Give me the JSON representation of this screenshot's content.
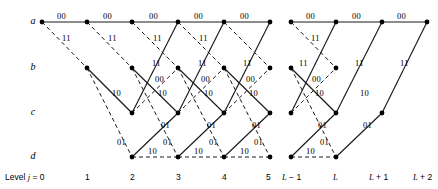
{
  "diagram": {
    "type": "trellis",
    "background_color": "#ffffff",
    "line_color": "#1a1a1a",
    "node_color": "#000000",
    "width": 438,
    "height": 189
  },
  "states": [
    {
      "id": "a",
      "label": "a",
      "y": 22
    },
    {
      "id": "b",
      "label": "b",
      "y": 68
    },
    {
      "id": "c",
      "label": "c",
      "y": 113
    },
    {
      "id": "d",
      "label": "d",
      "y": 157
    }
  ],
  "levels": [
    {
      "index": 0,
      "label": "Level j = 0",
      "x": 42,
      "label_x": 5,
      "italic_part": "j"
    },
    {
      "index": 1,
      "label": "1",
      "x": 87,
      "label_x": 85
    },
    {
      "index": 2,
      "label": "2",
      "x": 132,
      "label_x": 130
    },
    {
      "index": 3,
      "label": "3",
      "x": 178,
      "label_x": 176
    },
    {
      "index": 4,
      "label": "4",
      "x": 224,
      "label_x": 222
    },
    {
      "index": 5,
      "label": "5",
      "x": 270,
      "label_x": 266
    },
    {
      "index": 6,
      "label": "L − 1",
      "x": 291,
      "label_x": 282
    },
    {
      "index": 7,
      "label": "L",
      "x": 336,
      "label_x": 333
    },
    {
      "index": 8,
      "label": "L + 1",
      "x": 382,
      "label_x": 369
    },
    {
      "index": 9,
      "label": "L + 2",
      "x": 427,
      "label_x": 413
    }
  ],
  "nodes": [
    {
      "state": "a",
      "level": 0,
      "x": 42,
      "y": 22
    },
    {
      "state": "a",
      "level": 1,
      "x": 87,
      "y": 22
    },
    {
      "state": "a",
      "level": 2,
      "x": 132,
      "y": 22
    },
    {
      "state": "a",
      "level": 3,
      "x": 178,
      "y": 22
    },
    {
      "state": "a",
      "level": 4,
      "x": 224,
      "y": 22
    },
    {
      "state": "a",
      "level": 5,
      "x": 270,
      "y": 22
    },
    {
      "state": "a",
      "level": 6,
      "x": 291,
      "y": 22
    },
    {
      "state": "a",
      "level": 7,
      "x": 336,
      "y": 22
    },
    {
      "state": "a",
      "level": 8,
      "x": 382,
      "y": 22
    },
    {
      "state": "a",
      "level": 9,
      "x": 427,
      "y": 22
    },
    {
      "state": "b",
      "level": 1,
      "x": 87,
      "y": 68
    },
    {
      "state": "b",
      "level": 2,
      "x": 132,
      "y": 68
    },
    {
      "state": "b",
      "level": 3,
      "x": 178,
      "y": 68
    },
    {
      "state": "b",
      "level": 4,
      "x": 224,
      "y": 68
    },
    {
      "state": "b",
      "level": 5,
      "x": 270,
      "y": 68
    },
    {
      "state": "b",
      "level": 6,
      "x": 291,
      "y": 68
    },
    {
      "state": "b",
      "level": 7,
      "x": 336,
      "y": 68
    },
    {
      "state": "c",
      "level": 2,
      "x": 132,
      "y": 113
    },
    {
      "state": "c",
      "level": 3,
      "x": 178,
      "y": 113
    },
    {
      "state": "c",
      "level": 4,
      "x": 224,
      "y": 113
    },
    {
      "state": "c",
      "level": 5,
      "x": 270,
      "y": 113
    },
    {
      "state": "c",
      "level": 6,
      "x": 291,
      "y": 113
    },
    {
      "state": "c",
      "level": 7,
      "x": 336,
      "y": 113
    },
    {
      "state": "c",
      "level": 8,
      "x": 382,
      "y": 113
    },
    {
      "state": "d",
      "level": 2,
      "x": 132,
      "y": 157
    },
    {
      "state": "d",
      "level": 3,
      "x": 178,
      "y": 157
    },
    {
      "state": "d",
      "level": 4,
      "x": 224,
      "y": 157
    },
    {
      "state": "d",
      "level": 5,
      "x": 270,
      "y": 157
    },
    {
      "state": "d",
      "level": 6,
      "x": 291,
      "y": 157
    },
    {
      "state": "d",
      "level": 7,
      "x": 336,
      "y": 157
    }
  ],
  "edges": [
    {
      "from": [
        42,
        22
      ],
      "to": [
        87,
        22
      ],
      "style": "solid",
      "output": "00"
    },
    {
      "from": [
        87,
        22
      ],
      "to": [
        132,
        22
      ],
      "style": "solid",
      "output": "00"
    },
    {
      "from": [
        132,
        22
      ],
      "to": [
        178,
        22
      ],
      "style": "solid",
      "output": "00"
    },
    {
      "from": [
        178,
        22
      ],
      "to": [
        224,
        22
      ],
      "style": "solid",
      "output": "00"
    },
    {
      "from": [
        224,
        22
      ],
      "to": [
        270,
        22
      ],
      "style": "solid",
      "output": "00"
    },
    {
      "from": [
        291,
        22
      ],
      "to": [
        336,
        22
      ],
      "style": "solid",
      "output": "00"
    },
    {
      "from": [
        336,
        22
      ],
      "to": [
        382,
        22
      ],
      "style": "solid",
      "output": "00"
    },
    {
      "from": [
        382,
        22
      ],
      "to": [
        427,
        22
      ],
      "style": "solid",
      "output": "00"
    },
    {
      "from": [
        42,
        22
      ],
      "to": [
        87,
        68
      ],
      "style": "dashed",
      "output": "11"
    },
    {
      "from": [
        87,
        22
      ],
      "to": [
        132,
        68
      ],
      "style": "dashed",
      "output": "11"
    },
    {
      "from": [
        132,
        22
      ],
      "to": [
        178,
        68
      ],
      "style": "dashed",
      "output": "11"
    },
    {
      "from": [
        178,
        22
      ],
      "to": [
        224,
        68
      ],
      "style": "dashed",
      "output": "11"
    },
    {
      "from": [
        224,
        22
      ],
      "to": [
        270,
        68
      ],
      "style": "dashed",
      "output": "11"
    },
    {
      "from": [
        291,
        22
      ],
      "to": [
        336,
        68
      ],
      "style": "dashed",
      "output": "11"
    },
    {
      "from": [
        87,
        68
      ],
      "to": [
        132,
        113
      ],
      "style": "solid",
      "output": "10"
    },
    {
      "from": [
        132,
        68
      ],
      "to": [
        178,
        113
      ],
      "style": "solid",
      "output": "10"
    },
    {
      "from": [
        178,
        68
      ],
      "to": [
        224,
        113
      ],
      "style": "solid",
      "output": "10"
    },
    {
      "from": [
        224,
        68
      ],
      "to": [
        270,
        113
      ],
      "style": "solid",
      "output": "10"
    },
    {
      "from": [
        291,
        68
      ],
      "to": [
        336,
        113
      ],
      "style": "solid",
      "output": "10"
    },
    {
      "from": [
        87,
        68
      ],
      "to": [
        132,
        157
      ],
      "style": "dashed",
      "output": "01"
    },
    {
      "from": [
        132,
        68
      ],
      "to": [
        178,
        157
      ],
      "style": "dashed",
      "output": "01"
    },
    {
      "from": [
        178,
        68
      ],
      "to": [
        224,
        157
      ],
      "style": "dashed",
      "output": "01"
    },
    {
      "from": [
        224,
        68
      ],
      "to": [
        270,
        157
      ],
      "style": "dashed",
      "output": "01"
    },
    {
      "from": [
        291,
        68
      ],
      "to": [
        336,
        157
      ],
      "style": "dashed",
      "output": "01"
    },
    {
      "from": [
        132,
        113
      ],
      "to": [
        178,
        22
      ],
      "style": "solid",
      "output": "11"
    },
    {
      "from": [
        178,
        113
      ],
      "to": [
        224,
        22
      ],
      "style": "solid",
      "output": "11"
    },
    {
      "from": [
        224,
        113
      ],
      "to": [
        270,
        22
      ],
      "style": "solid",
      "output": "11"
    },
    {
      "from": [
        291,
        113
      ],
      "to": [
        336,
        22
      ],
      "style": "solid",
      "output": "11"
    },
    {
      "from": [
        336,
        113
      ],
      "to": [
        382,
        22
      ],
      "style": "solid",
      "output": "11"
    },
    {
      "from": [
        382,
        113
      ],
      "to": [
        427,
        22
      ],
      "style": "solid",
      "output": "11"
    },
    {
      "from": [
        132,
        113
      ],
      "to": [
        178,
        68
      ],
      "style": "dashed",
      "output": "00"
    },
    {
      "from": [
        178,
        113
      ],
      "to": [
        224,
        68
      ],
      "style": "dashed",
      "output": "00"
    },
    {
      "from": [
        224,
        113
      ],
      "to": [
        270,
        68
      ],
      "style": "dashed",
      "output": "00"
    },
    {
      "from": [
        291,
        113
      ],
      "to": [
        336,
        68
      ],
      "style": "dashed",
      "output": "00"
    },
    {
      "from": [
        132,
        157
      ],
      "to": [
        178,
        113
      ],
      "style": "solid",
      "output": "01"
    },
    {
      "from": [
        178,
        157
      ],
      "to": [
        224,
        113
      ],
      "style": "solid",
      "output": "01"
    },
    {
      "from": [
        224,
        157
      ],
      "to": [
        270,
        113
      ],
      "style": "solid",
      "output": "01"
    },
    {
      "from": [
        291,
        157
      ],
      "to": [
        336,
        113
      ],
      "style": "solid",
      "output": "01"
    },
    {
      "from": [
        336,
        157
      ],
      "to": [
        382,
        113
      ],
      "style": "solid",
      "output": "01"
    },
    {
      "from": [
        132,
        157
      ],
      "to": [
        178,
        157
      ],
      "style": "dashed",
      "output": "10"
    },
    {
      "from": [
        178,
        157
      ],
      "to": [
        224,
        157
      ],
      "style": "dashed",
      "output": "10"
    },
    {
      "from": [
        224,
        157
      ],
      "to": [
        270,
        157
      ],
      "style": "dashed",
      "output": "10"
    },
    {
      "from": [
        291,
        157
      ],
      "to": [
        336,
        157
      ],
      "style": "dashed",
      "output": "10"
    }
  ],
  "edge_labels": [
    {
      "text": "00",
      "x": 57,
      "y": 11
    },
    {
      "text": "00",
      "x": 103,
      "y": 11
    },
    {
      "text": "00",
      "x": 149,
      "y": 11
    },
    {
      "text": "00",
      "x": 194,
      "y": 11
    },
    {
      "text": "00",
      "x": 240,
      "y": 11
    },
    {
      "text": "00",
      "x": 306,
      "y": 11
    },
    {
      "text": "00",
      "x": 352,
      "y": 11
    },
    {
      "text": "00",
      "x": 397,
      "y": 11
    },
    {
      "text": "11",
      "x": 62,
      "y": 33
    },
    {
      "text": "11",
      "x": 108,
      "y": 33
    },
    {
      "text": "11",
      "x": 153,
      "y": 33
    },
    {
      "text": "11",
      "x": 199,
      "y": 33
    },
    {
      "text": "11",
      "x": 311,
      "y": 33
    },
    {
      "text": "11",
      "x": 152,
      "y": 58
    },
    {
      "text": "11",
      "x": 198,
      "y": 58
    },
    {
      "text": "11",
      "x": 243,
      "y": 58
    },
    {
      "text": "11",
      "x": 299,
      "y": 58
    },
    {
      "text": "11",
      "x": 355,
      "y": 58
    },
    {
      "text": "11",
      "x": 400,
      "y": 58
    },
    {
      "text": "00",
      "x": 155,
      "y": 74
    },
    {
      "text": "00",
      "x": 201,
      "y": 74
    },
    {
      "text": "00",
      "x": 246,
      "y": 74
    },
    {
      "text": "00",
      "x": 312,
      "y": 74
    },
    {
      "text": "10",
      "x": 112,
      "y": 88
    },
    {
      "text": "10",
      "x": 158,
      "y": 88
    },
    {
      "text": "10",
      "x": 204,
      "y": 88
    },
    {
      "text": "10",
      "x": 249,
      "y": 88
    },
    {
      "text": "10",
      "x": 315,
      "y": 88
    },
    {
      "text": "10",
      "x": 360,
      "y": 88
    },
    {
      "text": "01",
      "x": 161,
      "y": 120
    },
    {
      "text": "01",
      "x": 207,
      "y": 120
    },
    {
      "text": "01",
      "x": 252,
      "y": 120
    },
    {
      "text": "01",
      "x": 318,
      "y": 120
    },
    {
      "text": "01",
      "x": 363,
      "y": 120
    },
    {
      "text": "01",
      "x": 117,
      "y": 137
    },
    {
      "text": "01",
      "x": 163,
      "y": 137
    },
    {
      "text": "01",
      "x": 209,
      "y": 137
    },
    {
      "text": "01",
      "x": 254,
      "y": 137
    },
    {
      "text": "01",
      "x": 320,
      "y": 137
    },
    {
      "text": "10",
      "x": 148,
      "y": 146
    },
    {
      "text": "10",
      "x": 194,
      "y": 146
    },
    {
      "text": "10",
      "x": 240,
      "y": 146
    },
    {
      "text": "10",
      "x": 306,
      "y": 146
    }
  ]
}
